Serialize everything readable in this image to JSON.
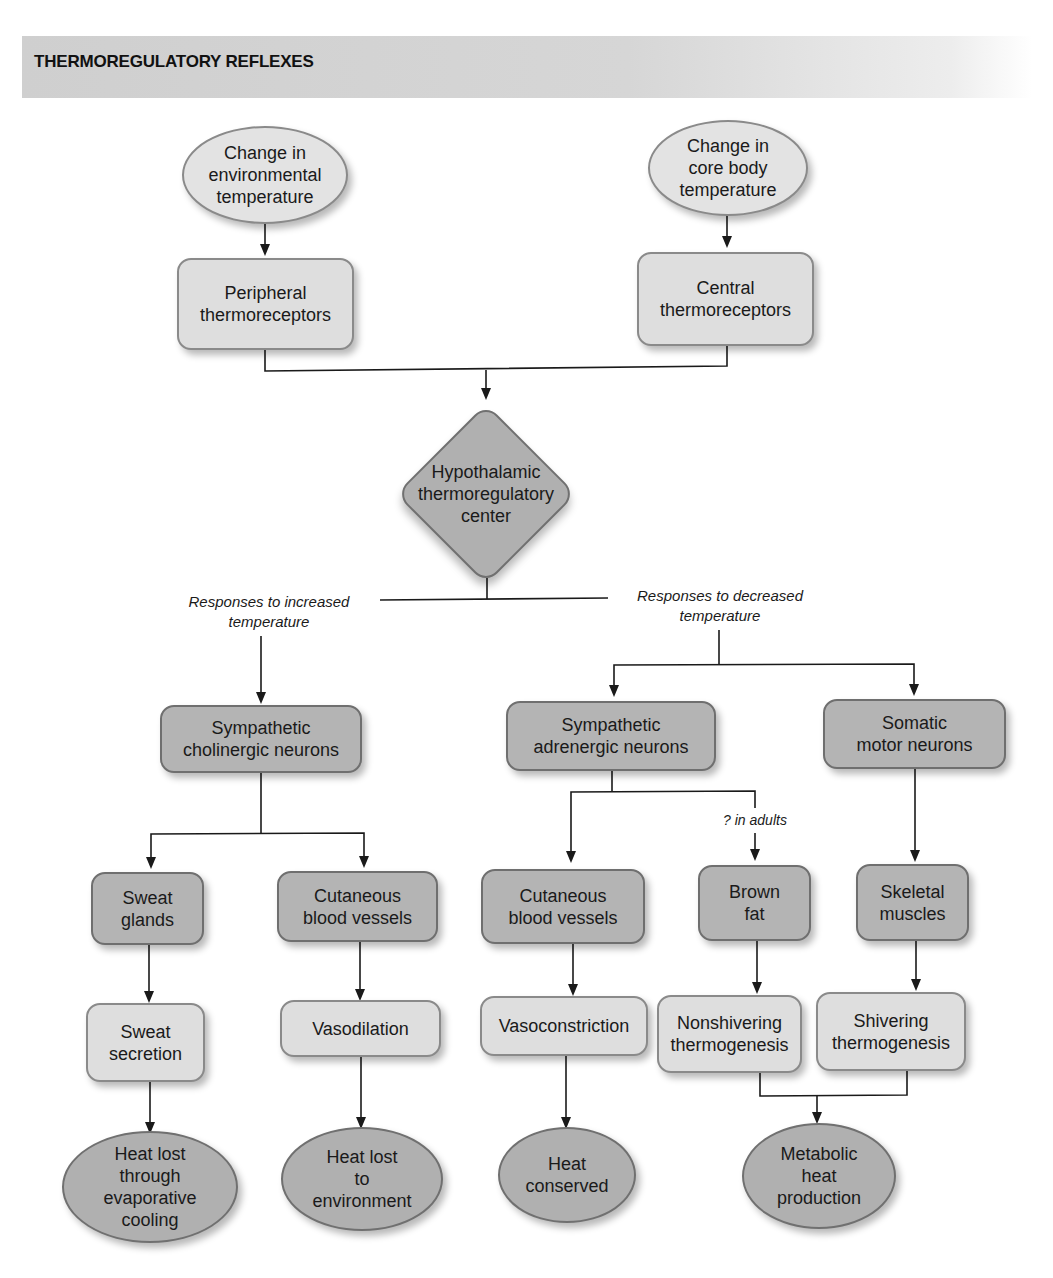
{
  "header": {
    "title": "THERMOREGULATORY REFLEXES"
  },
  "colors": {
    "light_node": "#dedede",
    "dark_node": "#b4b4b4",
    "banner": "#d0d0d0",
    "line": "#1a1a1a"
  },
  "nodes": {
    "env_temp": "Change in\nenvironmental\ntemperature",
    "core_temp": "Change in\ncore body\ntemperature",
    "peripheral": "Peripheral\nthermoreceptors",
    "central": "Central\nthermoreceptors",
    "hypothalamus": "Hypothalamic\nthermoregulatory\ncenter",
    "symp_cholinergic": "Sympathetic\ncholinergic neurons",
    "symp_adrenergic": "Sympathetic\nadrenergic neurons",
    "somatic": "Somatic\nmotor neurons",
    "sweat_glands": "Sweat\nglands",
    "cut_vessels_warm": "Cutaneous\nblood vessels",
    "cut_vessels_cold": "Cutaneous\nblood vessels",
    "brown_fat": "Brown\nfat",
    "skeletal": "Skeletal\nmuscles",
    "sweat_secretion": "Sweat\nsecretion",
    "vasodilation": "Vasodilation",
    "vasoconstriction": "Vasoconstriction",
    "nonshivering": "Nonshivering\nthermogenesis",
    "shivering": "Shivering\nthermogenesis",
    "heat_evap": "Heat lost\nthrough\nevaporative\ncooling",
    "heat_env": "Heat lost\nto\nenvironment",
    "heat_conserved": "Heat\nconserved",
    "metabolic": "Metabolic\nheat\nproduction"
  },
  "labels": {
    "increased": "Responses to increased\ntemperature",
    "decreased": "Responses to decreased\ntemperature",
    "adults": "? in adults"
  }
}
